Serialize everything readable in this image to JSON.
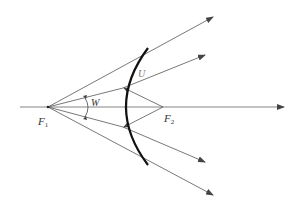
{
  "diagram": {
    "type": "optics-ray-diagram",
    "labels": {
      "f1": {
        "main": "F",
        "sub": "1"
      },
      "f2": {
        "main": "F",
        "sub": "2"
      },
      "angle_w": "W",
      "angle_u": "U"
    },
    "colors": {
      "ray": "#555555",
      "mirror": "#111111",
      "text": "#333333"
    },
    "points": {
      "F1": [
        48,
        107
      ],
      "F2": [
        163,
        107
      ]
    }
  }
}
